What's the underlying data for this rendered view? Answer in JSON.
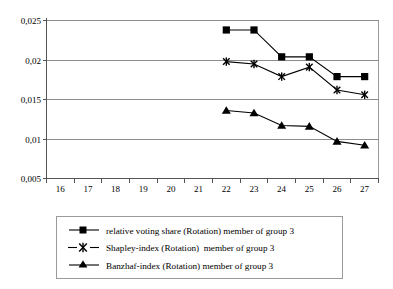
{
  "chart_data": {
    "type": "line",
    "title": "",
    "xlabel": "",
    "ylabel": "",
    "xlim": [
      15.5,
      27.5
    ],
    "ylim": [
      0.005,
      0.025
    ],
    "grid": true,
    "grid_axis": "y",
    "legend_position": "bottom",
    "x_ticks": [
      "16",
      "17",
      "18",
      "19",
      "20",
      "21",
      "22",
      "23",
      "24",
      "25",
      "26",
      "27"
    ],
    "x_tick_values": [
      16,
      17,
      18,
      19,
      20,
      21,
      22,
      23,
      24,
      25,
      26,
      27
    ],
    "y_ticks": [
      "0,005",
      "0,01",
      "0,015",
      "0,02",
      "0,025"
    ],
    "y_tick_values": [
      0.005,
      0.01,
      0.015,
      0.02,
      0.025
    ],
    "x": [
      22,
      23,
      24,
      25,
      26,
      27
    ],
    "series": [
      {
        "name": "relative voting share (Rotation) member of group 3",
        "marker": "square",
        "values": [
          0.0238,
          0.0238,
          0.0204,
          0.0204,
          0.0179,
          0.0179
        ]
      },
      {
        "name": "Shapley-index (Rotation)  member of group 3",
        "marker": "star",
        "values": [
          0.0198,
          0.0195,
          0.0179,
          0.0191,
          0.0162,
          0.0156
        ]
      },
      {
        "name": "Banzhaf-index (Rotation) member of group 3",
        "marker": "triangle",
        "values": [
          0.0136,
          0.0133,
          0.0117,
          0.0116,
          0.0097,
          0.0092
        ]
      }
    ]
  },
  "legend": {
    "entries": [
      {
        "label": "relative voting share (Rotation) member of group 3",
        "marker": "square"
      },
      {
        "label": "Shapley-index (Rotation)  member of group 3",
        "marker": "star"
      },
      {
        "label": "Banzhaf-index (Rotation) member of group 3",
        "marker": "triangle"
      }
    ]
  },
  "colors": {
    "series_stroke": "#000000",
    "gridline": "#8c8c8c",
    "frame": "#9a9a9a",
    "background": "#ffffff"
  }
}
